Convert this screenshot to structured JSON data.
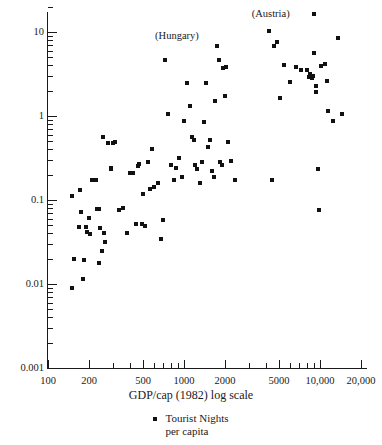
{
  "chart_data": {
    "type": "scatter",
    "title": "",
    "xlabel": "GDP/cap (1982) log scale",
    "ylabel": "",
    "xscale": "log",
    "yscale": "log",
    "xlim": [
      100,
      25000
    ],
    "ylim": [
      0.001,
      20
    ],
    "grid": false,
    "legend": {
      "position": "below-axis-centered",
      "entries": [
        {
          "marker": "square",
          "color": "#111111",
          "line1": "Tourist Nights",
          "line2": "per capita"
        }
      ]
    },
    "x_ticks_labeled": [
      {
        "value": 100,
        "label": "100"
      },
      {
        "value": 200,
        "label": "200"
      },
      {
        "value": 500,
        "label": "500"
      },
      {
        "value": 1000,
        "label": "1000"
      },
      {
        "value": 2000,
        "label": "2000"
      },
      {
        "value": 5000,
        "label": "5000"
      },
      {
        "value": 10000,
        "label": "10,000"
      },
      {
        "value": 20000,
        "label": "20,000"
      }
    ],
    "x_ticks_minor": [
      300,
      400,
      600,
      700,
      800,
      900,
      3000,
      4000,
      6000,
      7000,
      8000,
      9000
    ],
    "y_ticks_labeled": [
      {
        "value": 10,
        "label": "10"
      },
      {
        "value": 1,
        "label": "1"
      },
      {
        "value": 0.1,
        "label": "0.1"
      },
      {
        "value": 0.01,
        "label": "0.01"
      },
      {
        "value": 0.001,
        "label": "0.001"
      }
    ],
    "y_ticks_minor": [
      0.002,
      0.003,
      0.004,
      0.005,
      0.006,
      0.007,
      0.008,
      0.009,
      0.02,
      0.03,
      0.04,
      0.05,
      0.06,
      0.07,
      0.08,
      0.09,
      0.2,
      0.3,
      0.4,
      0.5,
      0.6,
      0.7,
      0.8,
      0.9,
      2,
      3,
      4,
      5,
      6,
      7,
      8,
      9,
      20
    ],
    "annotations": [
      {
        "text": "(Hungary)",
        "x": 1750,
        "y": 9.0,
        "anchor": "right-of-point"
      },
      {
        "text": "(Austria)",
        "x": 9000,
        "y": 16.5,
        "anchor": "right-of-point"
      }
    ],
    "series": [
      {
        "name": "Tourist Nights per capita",
        "marker": "square",
        "color": "#111111",
        "points": [
          [
            150,
            0.112
          ],
          [
            150,
            0.009
          ],
          [
            155,
            0.0198
          ],
          [
            170,
            0.048
          ],
          [
            172,
            0.132
          ],
          [
            175,
            0.0715
          ],
          [
            180,
            0.0115
          ],
          [
            185,
            0.0195
          ],
          [
            190,
            0.048
          ],
          [
            195,
            0.042
          ],
          [
            200,
            0.0615
          ],
          [
            205,
            0.039
          ],
          [
            212,
            0.175
          ],
          [
            225,
            0.175
          ],
          [
            230,
            0.078
          ],
          [
            235,
            0.079
          ],
          [
            238,
            0.0178
          ],
          [
            243,
            0.046
          ],
          [
            248,
            0.0245
          ],
          [
            255,
            0.56
          ],
          [
            258,
            0.0405
          ],
          [
            262,
            0.0318
          ],
          [
            275,
            0.48
          ],
          [
            288,
            0.235
          ],
          [
            292,
            0.238
          ],
          [
            300,
            0.48
          ],
          [
            310,
            0.49
          ],
          [
            330,
            0.076
          ],
          [
            355,
            0.0795
          ],
          [
            380,
            0.0405
          ],
          [
            400,
            0.212
          ],
          [
            420,
            0.212
          ],
          [
            440,
            0.052
          ],
          [
            460,
            0.255
          ],
          [
            470,
            0.268
          ],
          [
            490,
            0.052
          ],
          [
            500,
            0.118
          ],
          [
            520,
            0.049
          ],
          [
            540,
            0.282
          ],
          [
            560,
            0.136
          ],
          [
            580,
            0.408
          ],
          [
            600,
            0.142
          ],
          [
            640,
            0.158
          ],
          [
            680,
            0.034
          ],
          [
            700,
            0.0572
          ],
          [
            720,
            4.6
          ],
          [
            760,
            1.07
          ],
          [
            800,
            0.258
          ],
          [
            840,
            0.172
          ],
          [
            880,
            0.24
          ],
          [
            920,
            0.318
          ],
          [
            960,
            0.188
          ],
          [
            1000,
            0.88
          ],
          [
            1050,
            2.45
          ],
          [
            1100,
            1.3
          ],
          [
            1150,
            0.56
          ],
          [
            1180,
            0.525
          ],
          [
            1200,
            0.262
          ],
          [
            1250,
            0.232
          ],
          [
            1300,
            0.158
          ],
          [
            1350,
            0.285
          ],
          [
            1400,
            0.86
          ],
          [
            1450,
            2.45
          ],
          [
            1500,
            0.43
          ],
          [
            1550,
            0.525
          ],
          [
            1600,
            0.222
          ],
          [
            1650,
            0.188
          ],
          [
            1700,
            1.5
          ],
          [
            1750,
            6.8
          ],
          [
            1800,
            4.6
          ],
          [
            1850,
            0.285
          ],
          [
            1900,
            0.258
          ],
          [
            1950,
            3.7
          ],
          [
            2000,
            1.75
          ],
          [
            2050,
            3.85
          ],
          [
            2100,
            0.49
          ],
          [
            2200,
            0.292
          ],
          [
            2350,
            0.175
          ],
          [
            4200,
            10.2
          ],
          [
            4400,
            0.172
          ],
          [
            4600,
            6.8
          ],
          [
            4800,
            7.6
          ],
          [
            5100,
            1.62
          ],
          [
            5400,
            4.1
          ],
          [
            6000,
            2.55
          ],
          [
            6600,
            3.8
          ],
          [
            7300,
            3.55
          ],
          [
            8000,
            3.55
          ],
          [
            8300,
            2.9
          ],
          [
            8500,
            3.15
          ],
          [
            8700,
            2.85
          ],
          [
            8900,
            3.0
          ],
          [
            9000,
            16.5
          ],
          [
            9100,
            5.6
          ],
          [
            9300,
            1.95
          ],
          [
            9400,
            2.25
          ],
          [
            9600,
            0.235
          ],
          [
            9800,
            0.076
          ],
          [
            10200,
            3.9
          ],
          [
            10800,
            4.2
          ],
          [
            11200,
            2.6
          ],
          [
            11500,
            1.15
          ],
          [
            12500,
            0.88
          ],
          [
            13500,
            8.4
          ],
          [
            14500,
            1.05
          ]
        ]
      }
    ]
  }
}
